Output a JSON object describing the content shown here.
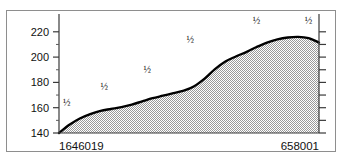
{
  "figure": {
    "background_color": "#ffffff",
    "frame_color": "#8e8e8e",
    "curve_color": "#000000",
    "fill_color": "#b5b5b5"
  },
  "chart_data": {
    "type": "area",
    "title": "",
    "subtitle": "",
    "xlabel": "",
    "ylabel": "",
    "grid": false,
    "legend": false,
    "ylim": [
      140,
      228
    ],
    "yticks": [
      140,
      160,
      180,
      200,
      220
    ],
    "ytick_labels": [
      "140",
      "160",
      "180",
      "200",
      "220"
    ],
    "y_minor_ticks": [
      150,
      170,
      190,
      210
    ],
    "right_axis_ticks": true,
    "right_axis_labels": [],
    "xlim": [
      0,
      1
    ],
    "xtick_labels": [
      "1646019",
      "658001"
    ],
    "x_axis_left_label": "1646019",
    "x_axis_right_label": "658001",
    "x": [
      0.0,
      0.04,
      0.08,
      0.12,
      0.16,
      0.2,
      0.24,
      0.28,
      0.32,
      0.36,
      0.4,
      0.44,
      0.48,
      0.52,
      0.56,
      0.6,
      0.64,
      0.68,
      0.72,
      0.76,
      0.8,
      0.84,
      0.88,
      0.92,
      0.96,
      1.0
    ],
    "values": [
      140.0,
      146.5,
      151.5,
      155.0,
      157.5,
      159.0,
      160.5,
      162.5,
      165.0,
      167.5,
      169.5,
      171.5,
      173.5,
      177.0,
      183.0,
      190.5,
      196.5,
      200.5,
      204.0,
      208.0,
      211.5,
      214.0,
      215.5,
      216.0,
      215.0,
      211.5
    ],
    "annotations": [
      {
        "label": "½",
        "x_frac": 0.015,
        "y_value": 161.5
      },
      {
        "label": "½",
        "x_frac": 0.16,
        "y_value": 174.0
      },
      {
        "label": "½",
        "x_frac": 0.325,
        "y_value": 187.5
      },
      {
        "label": "½",
        "x_frac": 0.49,
        "y_value": 211.0
      },
      {
        "label": "½",
        "x_frac": 0.745,
        "y_value": 226.0
      },
      {
        "label": "½",
        "x_frac": 0.945,
        "y_value": 226.0
      }
    ]
  }
}
